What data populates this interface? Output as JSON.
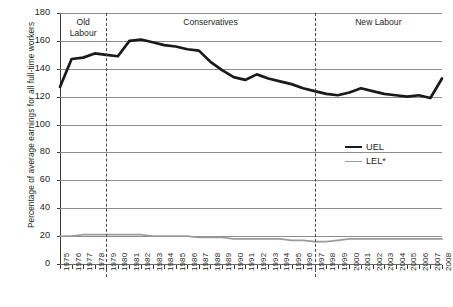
{
  "chart_data": {
    "type": "line",
    "title": "",
    "xlabel": "",
    "ylabel": "Percentage of average earnings for all full-time workers",
    "ylim": [
      0,
      180
    ],
    "ytick_step": 20,
    "yticks": [
      "0",
      "20",
      "40",
      "60",
      "80",
      "100",
      "120",
      "140",
      "160",
      "180"
    ],
    "grid": true,
    "legend_position": "center-right",
    "x": [
      1975,
      1976,
      1977,
      1978,
      1979,
      1980,
      1981,
      1982,
      1983,
      1984,
      1985,
      1986,
      1987,
      1988,
      1989,
      1990,
      1991,
      1992,
      1993,
      1994,
      1995,
      1996,
      1997,
      1998,
      1999,
      2000,
      2001,
      2002,
      2003,
      2004,
      2005,
      2006,
      2007,
      2008
    ],
    "categories": [
      "1975",
      "1976",
      "1977",
      "1978",
      "1979",
      "1980",
      "1981",
      "1982",
      "1983",
      "1984",
      "1985",
      "1986",
      "1987",
      "1988",
      "1989",
      "1990",
      "1991",
      "1992",
      "1993",
      "1994",
      "1995",
      "1996",
      "1997",
      "1998",
      "1999",
      "2000",
      "2001",
      "2002",
      "2003",
      "2004",
      "2005",
      "2006",
      "2007",
      "2008"
    ],
    "series": [
      {
        "name": "UEL",
        "color": "#1a1a1a",
        "values": [
          127,
          147,
          148,
          151,
          150,
          149,
          160,
          161,
          159,
          157,
          156,
          154,
          153,
          145,
          139,
          134,
          132,
          136,
          133,
          131,
          129,
          126,
          124,
          122,
          121,
          123,
          126,
          124,
          122,
          121,
          120,
          121,
          119,
          133
        ]
      },
      {
        "name": "LEL*",
        "color": "#9a9a9a",
        "values": [
          20,
          20,
          21,
          21,
          21,
          21,
          21,
          21,
          20,
          20,
          20,
          20,
          19,
          19,
          19,
          18,
          18,
          18,
          18,
          18,
          17,
          17,
          16,
          16,
          17,
          18,
          18,
          18,
          18,
          18,
          18,
          18,
          18,
          18
        ]
      }
    ],
    "annotations": [
      {
        "label": "Old\nLabour",
        "x_range": [
          1975,
          1979
        ],
        "divider_at": 1979
      },
      {
        "label": "Conservatives",
        "x_range": [
          1979,
          1997
        ],
        "divider_at": 1997
      },
      {
        "label": "New Labour",
        "x_range": [
          1997,
          2008
        ],
        "divider_at": null
      }
    ]
  },
  "legend": {
    "items": [
      {
        "label": "UEL",
        "icon": "line-swatch-thick-dark"
      },
      {
        "label": "LEL*",
        "icon": "line-swatch-thin-gray"
      }
    ]
  },
  "era_labels": {
    "old_labour": "Old\nLabour",
    "conservatives": "Conservatives",
    "new_labour": "New Labour"
  }
}
